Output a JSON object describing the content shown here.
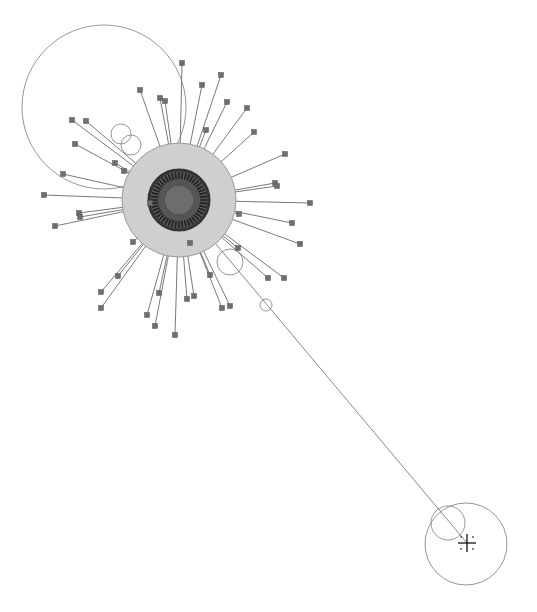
{
  "diagram": {
    "type": "network-graph",
    "hub": {
      "cx": 179,
      "cy": 200,
      "core_r": 30,
      "halo_r": 57,
      "inner_r": 14,
      "core_color": "#555555",
      "ring_color": "#333333",
      "halo_color": "#cfcfcf",
      "halo_stroke": "#9a9a9a"
    },
    "edge_color": "#7a7a7a",
    "node_color": "#6e6e6e",
    "node_size": 5,
    "leaf_nodes": [
      [
        182,
        63
      ],
      [
        221,
        75
      ],
      [
        202,
        85
      ],
      [
        140,
        90
      ],
      [
        160,
        98
      ],
      [
        165,
        101
      ],
      [
        227,
        102
      ],
      [
        247,
        108
      ],
      [
        72,
        120
      ],
      [
        86,
        121
      ],
      [
        206,
        130
      ],
      [
        254,
        132
      ],
      [
        75,
        144
      ],
      [
        285,
        154
      ],
      [
        115,
        163
      ],
      [
        63,
        174
      ],
      [
        124,
        171
      ],
      [
        275,
        183
      ],
      [
        277,
        186
      ],
      [
        44,
        195
      ],
      [
        310,
        203
      ],
      [
        150,
        203
      ],
      [
        79,
        213
      ],
      [
        80,
        217
      ],
      [
        239,
        214
      ],
      [
        55,
        226
      ],
      [
        292,
        223
      ],
      [
        300,
        244
      ],
      [
        133,
        242
      ],
      [
        190,
        243
      ],
      [
        238,
        248
      ],
      [
        210,
        275
      ],
      [
        118,
        276
      ],
      [
        268,
        278
      ],
      [
        284,
        278
      ],
      [
        101,
        292
      ],
      [
        101,
        308
      ],
      [
        159,
        293
      ],
      [
        230,
        306
      ],
      [
        147,
        315
      ],
      [
        187,
        299
      ],
      [
        194,
        296
      ],
      [
        222,
        308
      ],
      [
        175,
        335
      ],
      [
        155,
        326
      ]
    ],
    "big_loop": {
      "cx": 104,
      "cy": 107,
      "r": 82
    },
    "small_circles": [
      {
        "cx": 121,
        "cy": 134,
        "r": 10
      },
      {
        "cx": 131,
        "cy": 145,
        "r": 10
      },
      {
        "cx": 230,
        "cy": 262,
        "r": 13
      },
      {
        "cx": 266,
        "cy": 305,
        "r": 6
      },
      {
        "cx": 448,
        "cy": 523,
        "r": 17
      },
      {
        "cx": 466,
        "cy": 544,
        "r": 41
      }
    ],
    "long_edge": {
      "x1": 179,
      "y1": 200,
      "x2": 467,
      "y2": 543
    },
    "cursor": {
      "type": "crosshair",
      "x": 467,
      "y": 543
    }
  }
}
